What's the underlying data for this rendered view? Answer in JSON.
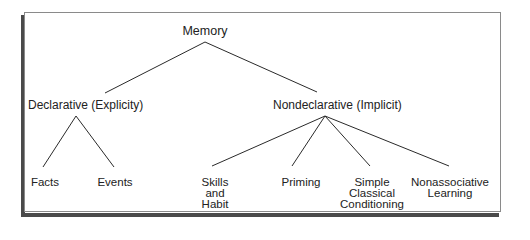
{
  "diagram": {
    "type": "tree",
    "root": {
      "label": "Memory",
      "children": [
        {
          "label": "Declarative (Explicity)",
          "children": [
            {
              "label": "Facts"
            },
            {
              "label": "Events"
            }
          ]
        },
        {
          "label": "Nondeclarative (Implicit)",
          "children": [
            {
              "label": "Skills\nand\nHabit",
              "lines": [
                "Skills",
                "and",
                "Habit"
              ]
            },
            {
              "label": "Priming",
              "lines": [
                "Priming"
              ]
            },
            {
              "label": "Simple Classical Conditioning",
              "lines": [
                "Simple",
                "Classical",
                "Conditioning"
              ]
            },
            {
              "label": "Nonassociative Learning",
              "lines": [
                "Nonassociative",
                "Learning"
              ]
            }
          ]
        }
      ]
    },
    "colors": {
      "line": "#2a2a2a",
      "text": "#222222",
      "frame_border": "#8a8a8a",
      "frame_shadow": "#4a4a4a",
      "background": "#ffffff"
    }
  }
}
